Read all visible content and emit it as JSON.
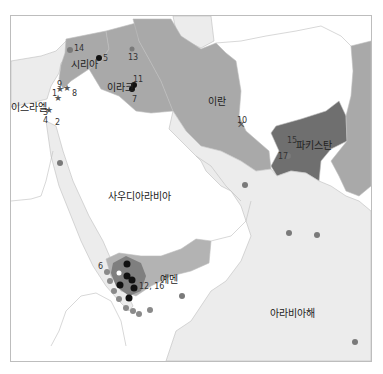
{
  "colors": {
    "sea_light": "#ececec",
    "land_white": "#ffffff",
    "country_mid": "#a9a9a9",
    "country_dark": "#6f6f6f",
    "yemen_fill": "#b3b3b3",
    "dot_gray": "#7a7a7a",
    "dot_black": "#111111",
    "border": "#bdbdbd"
  },
  "labels": {
    "israel": "이스라엘",
    "syria": "시리아",
    "iraq": "이라크",
    "iran": "이란",
    "pakistan": "파키스탄",
    "saudi": "사우디아라비아",
    "yemen": "예멘",
    "arabian_sea": "아라비아해"
  },
  "markers": [
    {
      "id": "1",
      "label": "1",
      "type": "star"
    },
    {
      "id": "2",
      "label": "2",
      "type": "star"
    },
    {
      "id": "3",
      "label": "3",
      "type": "star"
    },
    {
      "id": "4",
      "label": "4",
      "type": "star"
    },
    {
      "id": "5",
      "label": "5",
      "type": "dot"
    },
    {
      "id": "6",
      "label": "6",
      "type": "dot"
    },
    {
      "id": "7",
      "label": "7",
      "type": "dot"
    },
    {
      "id": "8",
      "label": "8",
      "type": "star"
    },
    {
      "id": "9",
      "label": "9",
      "type": "star"
    },
    {
      "id": "10",
      "label": "10",
      "type": "cross"
    },
    {
      "id": "11",
      "label": "11",
      "type": "dot"
    },
    {
      "id": "12_16",
      "label": "12, 16",
      "type": "dot"
    },
    {
      "id": "13",
      "label": "13",
      "type": "dot"
    },
    {
      "id": "14",
      "label": "14",
      "type": "dot"
    },
    {
      "id": "15",
      "label": "15",
      "type": "dot"
    },
    {
      "id": "17",
      "label": "17",
      "type": "dot"
    }
  ]
}
